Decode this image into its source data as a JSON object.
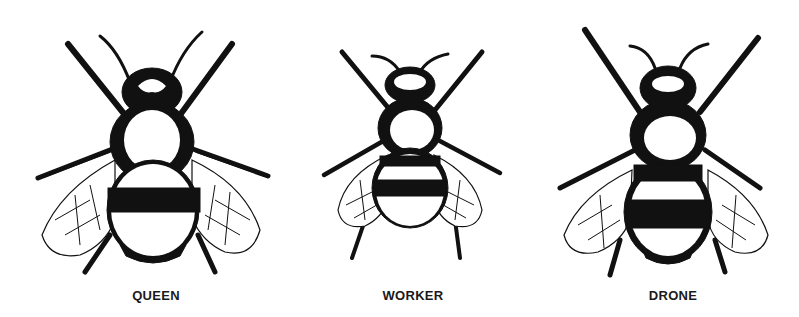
{
  "figure": {
    "labels": [
      {
        "id": "queen",
        "text": "QUEEN"
      },
      {
        "id": "worker",
        "text": "WORKER"
      },
      {
        "id": "drone",
        "text": "DRONE"
      }
    ],
    "colors": {
      "ink": "#111111",
      "background": "#ffffff"
    }
  }
}
